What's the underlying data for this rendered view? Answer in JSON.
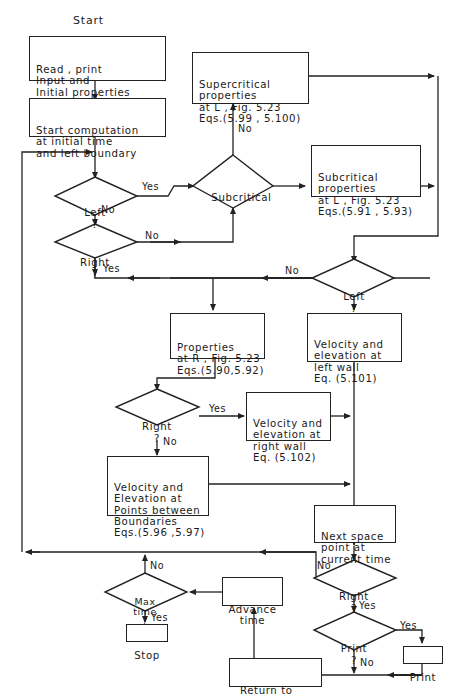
{
  "title": "Start",
  "boxes": {
    "read_input": [
      "Read , print",
      "Input and",
      "Initial properties"
    ],
    "start_comp": [
      "Start computation",
      "at initial time",
      "and left boundary"
    ],
    "supercritical": [
      "Supercritical",
      "properties",
      "at L , Fig. 5.23",
      "Eqs.(5.99 , 5.100)"
    ],
    "subcritical": [
      "Subcritical",
      "properties",
      "at L , Fig. 5.23",
      "Eqs.(5.91 , 5.93)"
    ],
    "props_r": [
      "Properties",
      "at R , Fig. 5.23",
      "Eqs.(5.90,5.92)"
    ],
    "vel_left": [
      "Velocity and",
      "elevation at",
      "left wall",
      "Eq. (5.101)"
    ],
    "vel_right": [
      "Velocity and",
      "elevation at",
      "right wall",
      "Eq. (5.102)"
    ],
    "vel_between": [
      "Velocity and",
      "Elevation at",
      "Points between",
      "Boundaries",
      "Eqs.(5.96 ,5.97)"
    ],
    "next_space": [
      "Next space",
      "point at",
      "current time"
    ],
    "advance_time": [
      "Advance",
      "time"
    ],
    "stop": [
      "Stop"
    ],
    "return_left": [
      "Return to",
      "left boundary"
    ],
    "print": [
      "Print"
    ]
  },
  "decisions": {
    "left_1": [
      "Left",
      "?"
    ],
    "subcritical": [
      "Subcritical"
    ],
    "right_1": [
      "Right",
      "?"
    ],
    "left_2": [
      "Left",
      "?"
    ],
    "right_2": [
      "Right",
      "?"
    ],
    "right_3": [
      "Right",
      "?"
    ],
    "max_time": [
      "Max",
      "time",
      "?"
    ],
    "print_q": [
      "Print",
      "?"
    ]
  },
  "edge_labels": {
    "left1_yes": "Yes",
    "left1_no": "No",
    "sub_no": "No",
    "right1_no": "No",
    "right1_yes": "Yes",
    "left2_no": "No",
    "right2_yes": "Yes",
    "right2_no": "No",
    "right3_no": "No",
    "right3_yes": "Yes",
    "max_no": "No",
    "max_yes": "Yes",
    "print_yes": "Yes",
    "print_no": "No"
  },
  "colors": {
    "ink": "#222222",
    "background": "#ffffff"
  }
}
